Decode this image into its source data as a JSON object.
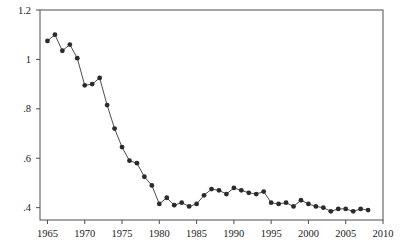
{
  "chart_data": {
    "type": "line",
    "title": "",
    "subtitle": "",
    "xlabel": "",
    "ylabel": "Transfer taxes/total tax revenues",
    "xlim": [
      1964,
      2010
    ],
    "ylim": [
      0.35,
      1.2
    ],
    "grid": false,
    "legend": null,
    "marker": "filled-circle",
    "xticks": [
      1965,
      1970,
      1975,
      1980,
      1985,
      1990,
      1995,
      2000,
      2005,
      2010
    ],
    "xtick_labels": [
      "1965",
      "1970",
      "1975",
      "1980",
      "1985",
      "1990",
      "1995",
      "2000",
      "2005",
      "2010"
    ],
    "yticks": [
      0.4,
      0.6,
      0.8,
      1.0,
      1.2
    ],
    "ytick_labels": [
      ".4",
      ".6",
      ".8",
      "1",
      "1.2"
    ],
    "x": [
      1965,
      1966,
      1967,
      1968,
      1969,
      1970,
      1971,
      1972,
      1973,
      1974,
      1975,
      1976,
      1977,
      1978,
      1979,
      1980,
      1981,
      1982,
      1983,
      1984,
      1985,
      1986,
      1987,
      1988,
      1989,
      1990,
      1991,
      1992,
      1993,
      1994,
      1995,
      1996,
      1997,
      1998,
      1999,
      2000,
      2001,
      2002,
      2003,
      2004,
      2005,
      2006,
      2007,
      2008
    ],
    "values": [
      1.075,
      1.1,
      1.035,
      1.06,
      1.005,
      0.895,
      0.9,
      0.925,
      0.815,
      0.72,
      0.645,
      0.59,
      0.58,
      0.525,
      0.49,
      0.415,
      0.44,
      0.41,
      0.42,
      0.405,
      0.415,
      0.45,
      0.475,
      0.47,
      0.455,
      0.48,
      0.47,
      0.46,
      0.455,
      0.465,
      0.42,
      0.415,
      0.42,
      0.405,
      0.43,
      0.415,
      0.405,
      0.4,
      0.385,
      0.395,
      0.395,
      0.385,
      0.395,
      0.39
    ],
    "series_name": "Transfer taxes/total tax revenues",
    "line_color": "#3a3a3a",
    "marker_color": "#2b2b2b",
    "frame_color": "#4d4d4d",
    "background_color": "#ffffff"
  }
}
